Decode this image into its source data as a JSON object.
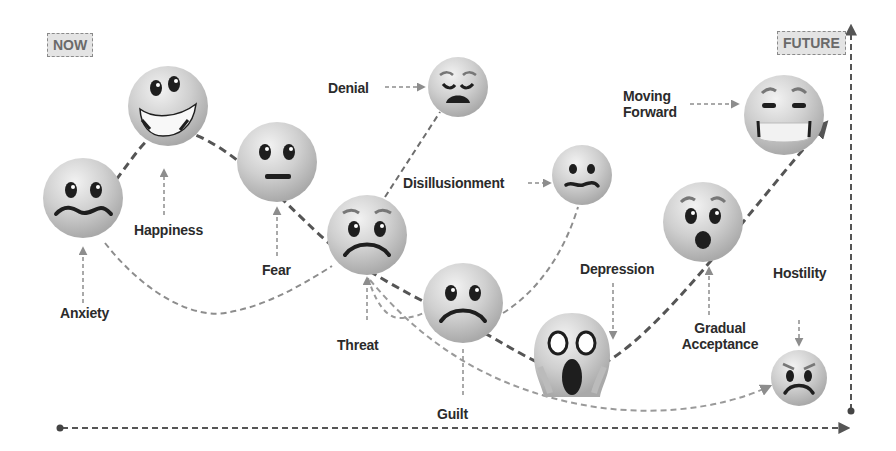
{
  "tags": {
    "now": "NOW",
    "future": "FUTURE"
  },
  "stages": [
    {
      "id": "anxiety",
      "label": "Anxiety",
      "emoji": "anxious-wavy-mouth-face",
      "cx": 83,
      "cy": 198,
      "r": 40
    },
    {
      "id": "happiness",
      "label": "Happiness",
      "emoji": "grinning-face",
      "cx": 168,
      "cy": 106,
      "r": 40
    },
    {
      "id": "fear",
      "label": "Fear",
      "emoji": "neutral-flat-mouth-face",
      "cx": 277,
      "cy": 162,
      "r": 40
    },
    {
      "id": "threat",
      "label": "Threat",
      "emoji": "worried-frowning-face",
      "cx": 367,
      "cy": 235,
      "r": 40
    },
    {
      "id": "denial",
      "label": "Denial",
      "emoji": "weary-face",
      "cx": 458,
      "cy": 87,
      "r": 30
    },
    {
      "id": "disillusionment",
      "label": "Disillusionment",
      "emoji": "confused-wavy-mouth-face",
      "cx": 582,
      "cy": 175,
      "r": 30
    },
    {
      "id": "guilt",
      "label": "Guilt",
      "emoji": "frowning-face",
      "cx": 463,
      "cy": 303,
      "r": 40
    },
    {
      "id": "depression",
      "label": "Depression",
      "emoji": "screaming-face",
      "cx": 572,
      "cy": 355,
      "r": 40
    },
    {
      "id": "gradual_acceptance",
      "label_line1": "Gradual",
      "label_line2": "Acceptance",
      "emoji": "surprised-face",
      "cx": 703,
      "cy": 222,
      "r": 40
    },
    {
      "id": "moving_forward",
      "label_line1": "Moving",
      "label_line2": "Forward",
      "emoji": "grimacing-relieved-face",
      "cx": 784,
      "cy": 115,
      "r": 40
    },
    {
      "id": "hostility",
      "label": "Hostility",
      "emoji": "angry-face",
      "cx": 799,
      "cy": 378,
      "r": 28
    }
  ],
  "axes": {
    "x_axis": "time-arrow-now-to-future",
    "y_axis": "vertical-arrow-up"
  },
  "colors": {
    "emoji_fill": "#d4d4d4",
    "emoji_feature": "#1e1e1e",
    "main_curve": "#555555",
    "light_curve": "#9a9a9a",
    "text": "#2b2b2b",
    "tag_bg": "#e4e4e4"
  }
}
